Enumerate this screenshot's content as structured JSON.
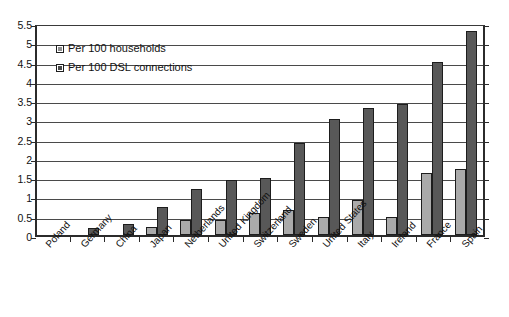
{
  "chart_data": {
    "type": "bar",
    "title": "",
    "subtitle": "",
    "xlabel": "",
    "ylabel": "",
    "ylim": [
      0,
      5.5
    ],
    "ytick_step": 0.5,
    "yticks": [
      "5.5",
      "5",
      "4.5",
      "4",
      "3.5",
      "3",
      "2.5",
      "2",
      "1.5",
      "1",
      "0.5",
      "0"
    ],
    "grid": true,
    "legend_position": "top-left",
    "categories": [
      "Poland",
      "Germany",
      "China",
      "Japan",
      "Netherlands",
      "United Kingdom",
      "Switzerland",
      "Sweden",
      "United States",
      "Italy",
      "Ireland",
      "France",
      "Spain"
    ],
    "series": [
      {
        "name": "Per 100 households",
        "color": "#aaaaaa",
        "values": [
          0,
          0,
          0,
          0.2,
          0.38,
          0.38,
          0.58,
          0.65,
          0.48,
          0.9,
          0.48,
          1.6,
          1.7
        ]
      },
      {
        "name": "Per 100 DSL connections",
        "color": "#585858",
        "values": [
          0,
          0.18,
          0.28,
          0.72,
          1.2,
          1.42,
          1.48,
          2.4,
          3.0,
          3.3,
          3.4,
          4.5,
          5.3
        ]
      }
    ]
  },
  "legend": {
    "entries": [
      {
        "label": "Per 100 households"
      },
      {
        "label": "Per 100 DSL connections"
      }
    ]
  },
  "colors": {
    "series_light": "#aaaaaa",
    "series_dark": "#585858",
    "axis": "#2b2b2b",
    "gridline": "#4a4a4a",
    "text": "#111111",
    "background": "#ffffff"
  }
}
